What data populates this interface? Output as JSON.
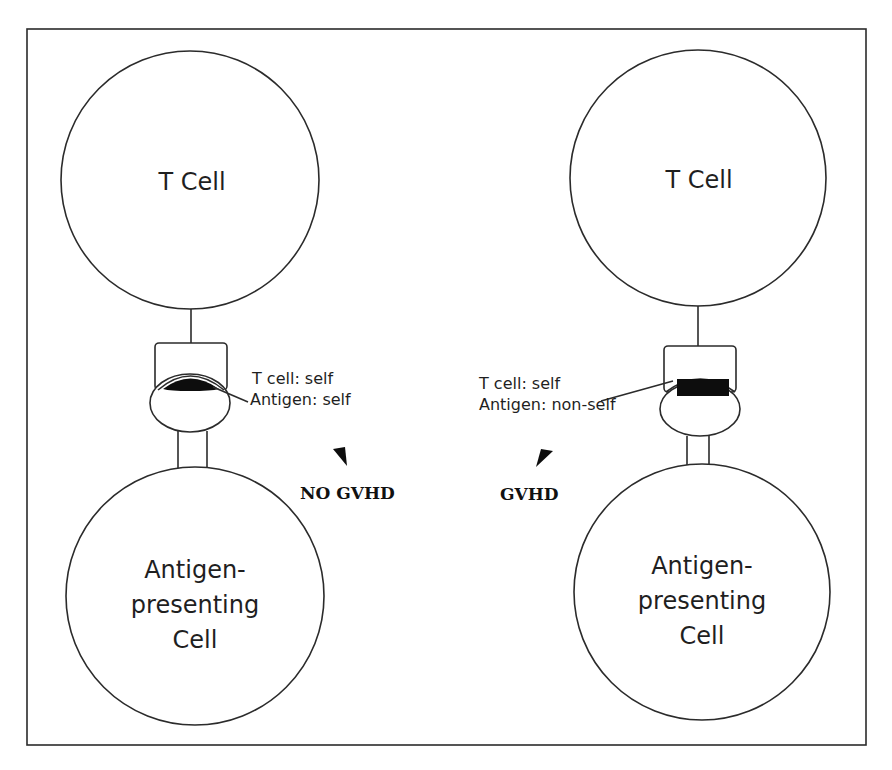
{
  "figure": {
    "frame": {
      "x": 27,
      "y": 29,
      "width": 839,
      "height": 716
    },
    "colors": {
      "stroke": "#2b2b2b",
      "ink": "#0d0d0d",
      "background": "#ffffff"
    }
  },
  "left_panel": {
    "t_cell": {
      "label": "T Cell"
    },
    "apc": {
      "label_lines": [
        "Antigen-",
        "presenting",
        "Cell"
      ]
    },
    "annotation": {
      "t_cell_line": "T cell: self",
      "antigen_line": "Antigen: self"
    },
    "outcome": {
      "label": "NO GVHD",
      "arrow": "arrowhead-down-right"
    }
  },
  "right_panel": {
    "t_cell": {
      "label": "T Cell"
    },
    "apc": {
      "label_lines": [
        "Antigen-",
        "presenting",
        "Cell"
      ]
    },
    "annotation": {
      "t_cell_line": "T cell: self",
      "antigen_line": "Antigen: non-self"
    },
    "outcome": {
      "label": "GVHD",
      "arrow": "arrowhead-down-left"
    }
  }
}
